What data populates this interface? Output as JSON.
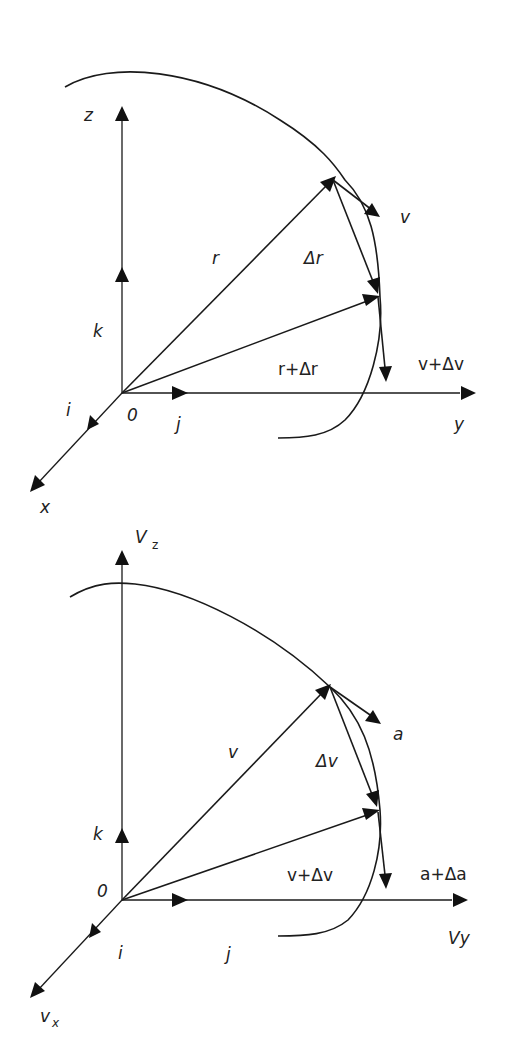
{
  "diagrams": [
    {
      "name": "position-vector-diagram",
      "axes": {
        "vertical": "z",
        "horizontal": "y",
        "depth": "x"
      },
      "origin_label": "0",
      "unit_vectors": {
        "i": "i",
        "j": "j",
        "k": "k"
      },
      "vectors": {
        "first": "r",
        "second": "r+Δr",
        "difference": "Δr",
        "tangent_first": "v",
        "tangent_second": "v+Δv"
      }
    },
    {
      "name": "velocity-hodograph-diagram",
      "axes": {
        "vertical": "V",
        "vertical_sub": "z",
        "horizontal": "Vy",
        "depth": "v",
        "depth_sub": "x"
      },
      "origin_label": "0",
      "unit_vectors": {
        "i": "i",
        "j": "j",
        "k": "k"
      },
      "vectors": {
        "first": "v",
        "second": "v+Δv",
        "difference": "Δv",
        "tangent_first": "a",
        "tangent_second": "a+Δa"
      }
    }
  ]
}
